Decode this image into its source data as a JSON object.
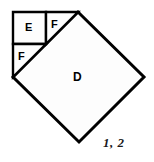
{
  "figure": {
    "caption": "1, 2",
    "background_color": "#ffffff",
    "stroke_color": "#000000",
    "fill_color": "#fdfdfd",
    "shapes": [
      {
        "id": "D",
        "label": "D",
        "kind": "square-rotated",
        "description": "large tilted square (diamond) occupying the center-right of the figure",
        "vertices": [
          [
            78,
            12
          ],
          [
            144,
            77
          ],
          [
            79,
            142
          ],
          [
            13,
            77
          ]
        ]
      },
      {
        "id": "E",
        "label": "E",
        "kind": "square",
        "description": "small square in the upper-left corner",
        "vertices": [
          [
            13,
            12
          ],
          [
            46,
            12
          ],
          [
            46,
            44
          ],
          [
            13,
            44
          ]
        ]
      },
      {
        "id": "F1",
        "label": "F",
        "kind": "right-triangle",
        "description": "right triangle to the right of square E",
        "vertices": [
          [
            46,
            12
          ],
          [
            78,
            12
          ],
          [
            46,
            44
          ]
        ]
      },
      {
        "id": "F2",
        "label": "F",
        "kind": "right-triangle",
        "description": "right triangle below square E",
        "vertices": [
          [
            13,
            44
          ],
          [
            46,
            44
          ],
          [
            13,
            77
          ]
        ]
      }
    ]
  }
}
